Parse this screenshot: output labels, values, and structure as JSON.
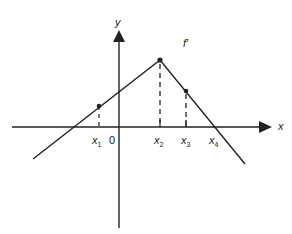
{
  "diagram": {
    "title": "",
    "function_label": "f′",
    "axes": {
      "x_label": "x",
      "y_label": "y",
      "origin_label": "0"
    },
    "x_tick_labels": [
      {
        "name": "x",
        "sub": "1"
      },
      {
        "name": "x",
        "sub": "2"
      },
      {
        "name": "x",
        "sub": "3"
      },
      {
        "name": "x",
        "sub": "4"
      }
    ],
    "colors": {
      "line": "#222222",
      "background": "#ffffff"
    }
  }
}
